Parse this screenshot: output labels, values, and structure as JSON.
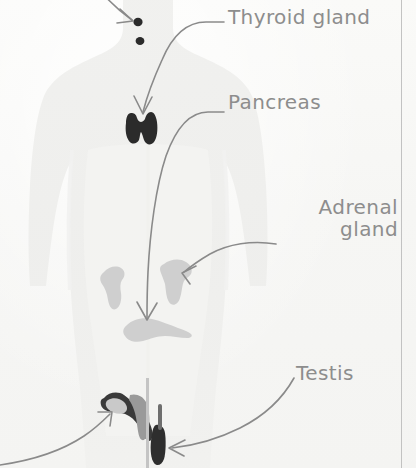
{
  "page": {
    "kind": "textbook-scan",
    "background_color": "#f7f7f5",
    "margin_rule_color": "#b9b9b9",
    "ink_color": "#8d8d8d",
    "organ_dark_color": "#2b2b2b",
    "organ_light_color": "#cfcfcf",
    "body_silhouette_color": "#efefed"
  },
  "labels": {
    "thyroid": "Thyroid gland",
    "pancreas": "Pancreas",
    "adrenal_line1": "Adrenal",
    "adrenal_line2": "gland",
    "testis": "Testis"
  },
  "organs": [
    {
      "name": "pituitary-gland-dot",
      "shade": "dark",
      "x": 138,
      "y": 22
    },
    {
      "name": "pineal-gland-dot",
      "shade": "dark",
      "x": 140,
      "y": 41
    },
    {
      "name": "thyroid-gland",
      "shade": "dark",
      "x": 141,
      "y": 126
    },
    {
      "name": "adrenal-gland-left",
      "shade": "light",
      "x": 113,
      "y": 283
    },
    {
      "name": "adrenal-gland-right",
      "shade": "light",
      "x": 171,
      "y": 280
    },
    {
      "name": "pancreas",
      "shade": "light",
      "x": 148,
      "y": 329
    },
    {
      "name": "ovary-uterus",
      "shade": "dark",
      "x": 117,
      "y": 410
    },
    {
      "name": "testis",
      "shade": "dark",
      "x": 158,
      "y": 443
    }
  ],
  "leader_arrows": [
    {
      "name": "arrow-to-pituitary-dot",
      "from": "offscreen-top-left",
      "to": "pituitary-gland-dot"
    },
    {
      "name": "arrow-thyroid-label-to-thyroid",
      "from": "thyroid-label",
      "to": "thyroid-gland"
    },
    {
      "name": "arrow-pancreas-label-to-pancreas",
      "from": "pancreas-label",
      "to": "pancreas"
    },
    {
      "name": "arrow-adrenal-label-to-adrenal",
      "from": "adrenal-label",
      "to": "adrenal-gland-right"
    },
    {
      "name": "arrow-testis-label-to-testis",
      "from": "testis-label",
      "to": "testis"
    },
    {
      "name": "arrow-from-bottom-left-to-ovary",
      "from": "offscreen-bottom-left",
      "to": "ovary-uterus"
    }
  ]
}
